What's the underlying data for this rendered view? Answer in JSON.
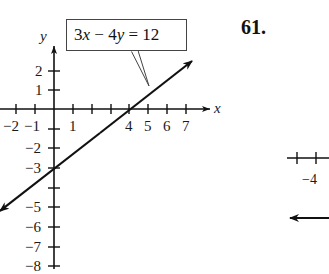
{
  "problem": {
    "number": "61."
  },
  "chart_data": {
    "type": "line",
    "title": "",
    "equation": "3x − 4y = 12",
    "xlabel": "x",
    "ylabel": "y",
    "xlim": [
      -2.8,
      8
    ],
    "ylim": [
      -8,
      3
    ],
    "grid": false,
    "legend": null,
    "x_tick_labels": [
      "−2",
      "−1",
      "1",
      "4",
      "5",
      "6",
      "7"
    ],
    "y_tick_labels": [
      "2",
      "1",
      "−2",
      "−3",
      "−5",
      "−6",
      "−7",
      "−8"
    ],
    "series": [
      {
        "name": "3x − 4y = 12",
        "slope": 0.75,
        "intercept": -3,
        "points": [
          [
            -3,
            -5.25
          ],
          [
            0,
            -3
          ],
          [
            4,
            0
          ],
          [
            7.3,
            2.5
          ]
        ]
      }
    ],
    "annotations": [
      {
        "text": "3x − 4y = 12",
        "type": "callout",
        "points_to": [
          5,
          0.75
        ]
      }
    ]
  },
  "partial_figure": {
    "tick_label": "−4"
  },
  "labels": {
    "x_axis": "x",
    "y_axis": "y",
    "callout": "3x − 4y = 12",
    "xt_m2": "−2",
    "xt_m1": "−1",
    "xt_1": "1",
    "xt_4": "4",
    "xt_5": "5",
    "xt_6": "6",
    "xt_7": "7",
    "yt_2": "2",
    "yt_1": "1",
    "yt_m2": "−2",
    "yt_m3": "−3",
    "yt_m5": "−5",
    "yt_m6": "−6",
    "yt_m7": "−7",
    "yt_m8": "−8",
    "partial_tick": "−4"
  }
}
